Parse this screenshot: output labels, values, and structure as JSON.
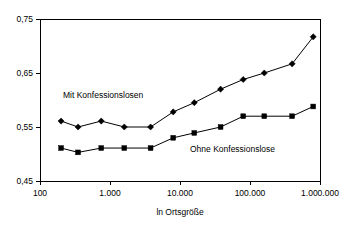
{
  "chart_data": {
    "type": "line",
    "title": "",
    "xlabel": "ln Ortsgröße",
    "ylabel": "",
    "xscale": "log",
    "xlim": [
      100,
      1000000
    ],
    "ylim": [
      0.45,
      0.75
    ],
    "grid": false,
    "legend_position": "inline-annotation",
    "x_tick_labels": [
      "100",
      "1.000",
      "10.000",
      "100.000",
      "1.000.000"
    ],
    "x_tick_values": [
      100,
      1000,
      10000,
      100000,
      1000000
    ],
    "y_tick_labels": [
      "0,75",
      "0,65",
      "0,55",
      "0,45"
    ],
    "y_tick_values": [
      0.75,
      0.65,
      0.55,
      0.45
    ],
    "x": [
      200,
      350,
      750,
      1600,
      3800,
      8000,
      16000,
      38000,
      80000,
      160000,
      400000,
      800000
    ],
    "series": [
      {
        "name": "Mit Konfessionslosen",
        "marker": "diamond",
        "values": [
          0.561,
          0.55,
          0.561,
          0.55,
          0.55,
          0.578,
          0.595,
          0.62,
          0.638,
          0.65,
          0.667,
          0.717
        ]
      },
      {
        "name": "Ohne Konfessionslose",
        "marker": "square",
        "values": [
          0.511,
          0.503,
          0.511,
          0.511,
          0.511,
          0.53,
          0.539,
          0.55,
          0.57,
          0.57,
          0.57,
          0.588
        ]
      }
    ],
    "annotations": [
      {
        "text": "Mit Konfessionslosen",
        "x_px": 63,
        "y_px": 98
      },
      {
        "text": "Ohne Konfessionslose",
        "x_px": 190,
        "y_px": 152
      }
    ]
  }
}
